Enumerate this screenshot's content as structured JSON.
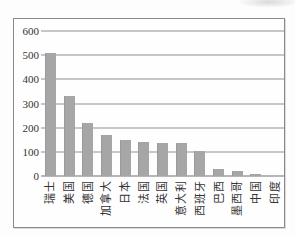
{
  "chart_data": {
    "type": "bar",
    "categories": [
      "瑞士",
      "美国",
      "德国",
      "加拿大",
      "日本",
      "法国",
      "英国",
      "意大利",
      "西班牙",
      "巴西",
      "墨西哥",
      "中国",
      "印度"
    ],
    "values": [
      510,
      330,
      220,
      170,
      150,
      140,
      135,
      135,
      105,
      30,
      20,
      8,
      0
    ],
    "title": "",
    "xlabel": "",
    "ylabel": "",
    "ylim": [
      0,
      600
    ],
    "ytick_interval": 100,
    "ytick_labels": [
      "600",
      "500",
      "400",
      "300",
      "200",
      "100",
      "0"
    ],
    "grid": true,
    "legend_position": "none",
    "colors": {
      "bar": "#a6a6a6",
      "bar_edge": "#9a9a9a",
      "gridline": "#8f8f8f",
      "baseline": "#6e6e6e",
      "axis_text": "#333333",
      "frame_border": "#8a8a8a",
      "background": "#fdfdfd"
    }
  }
}
